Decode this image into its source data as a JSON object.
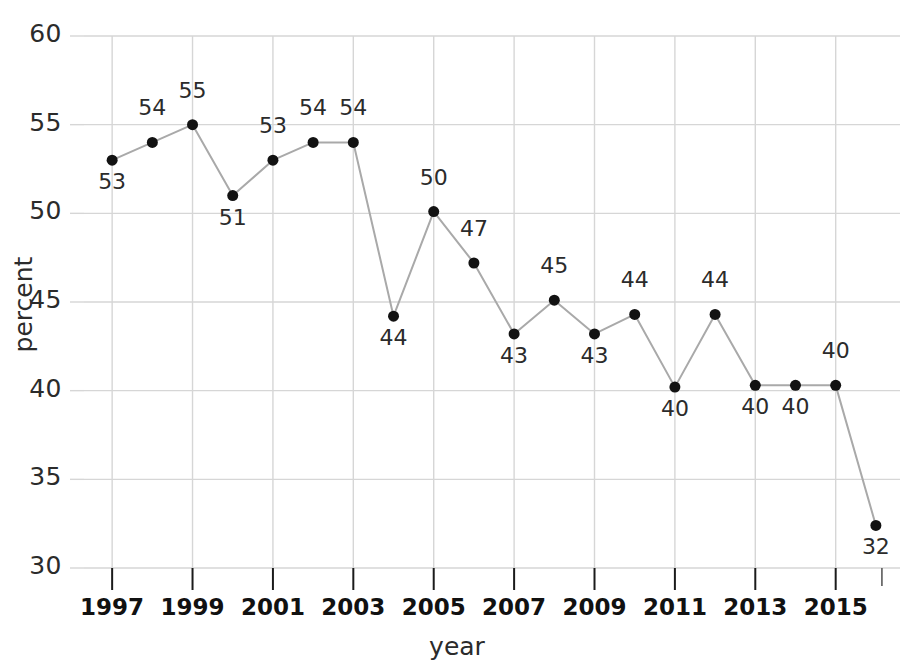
{
  "chart_data": {
    "type": "line",
    "title": "",
    "xlabel": "year",
    "ylabel": "percent",
    "xlim": [
      1996.3,
      2016.6
    ],
    "ylim": [
      30,
      60
    ],
    "grid": true,
    "legend": false,
    "y_ticks": [
      30,
      35,
      40,
      45,
      50,
      55,
      60
    ],
    "y_tick_labels": [
      "30",
      "35",
      "40",
      "45",
      "50",
      "55",
      "60"
    ],
    "x_ticks": [
      1997,
      1999,
      2001,
      2003,
      2005,
      2007,
      2009,
      2011,
      2013,
      2015
    ],
    "x_tick_labels": [
      "1997",
      "1999",
      "2001",
      "2003",
      "2005",
      "2007",
      "2009",
      "2011",
      "2013",
      "2015"
    ],
    "x": [
      1997,
      1998,
      1999,
      2000,
      2001,
      2002,
      2003,
      2004,
      2005,
      2006,
      2007,
      2008,
      2009,
      2010,
      2011,
      2012,
      2013,
      2014,
      2015,
      2016
    ],
    "values": [
      53,
      54,
      55,
      51,
      53,
      54,
      54,
      44.2,
      50.1,
      47.2,
      43.2,
      45.1,
      43.2,
      44.3,
      40.2,
      44.3,
      40.3,
      40.3,
      40.3,
      32.4
    ],
    "point_labels": [
      "53",
      "54",
      "55",
      "51",
      "53",
      "54",
      "54",
      "44",
      "50",
      "47",
      "43",
      "45",
      "43",
      "44",
      "40",
      "44",
      "40",
      "40",
      "40",
      "32"
    ],
    "label_positions": [
      "below",
      "above",
      "above",
      "below",
      "above",
      "above",
      "above",
      "below",
      "above",
      "above",
      "below",
      "above",
      "below",
      "above",
      "below",
      "above",
      "below",
      "below",
      "above",
      "below"
    ],
    "colors": {
      "line": "#a9a9a9",
      "marker": "#121212",
      "grid": "#d6d6d6",
      "axis_text": "#2b2b2b",
      "background": "#ffffff"
    },
    "marker_size": 11,
    "line_width": 2
  }
}
